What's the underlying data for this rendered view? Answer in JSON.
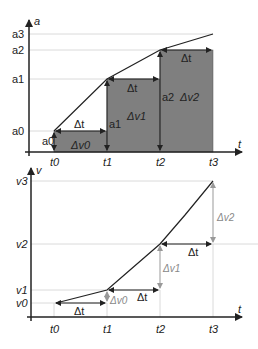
{
  "top_chart": {
    "y_axis_label": "a",
    "x_axis_label": "t",
    "y_ticks": [
      "a0",
      "a1",
      "a2",
      "a3"
    ],
    "x_ticks": [
      "t0",
      "t1",
      "t2",
      "t3"
    ],
    "rect_height_labels": [
      "a0",
      "a1",
      "a2"
    ],
    "rect_width_label": "Δt",
    "rect_area_labels": [
      "Δv0",
      "Δv1",
      "Δv2"
    ],
    "fill_color": "#7f7f7f"
  },
  "bottom_chart": {
    "y_axis_label": "v",
    "x_axis_label": "t",
    "y_ticks": [
      "v0",
      "v1",
      "v2",
      "v3"
    ],
    "x_ticks": [
      "t0",
      "t1",
      "t2",
      "t3"
    ],
    "step_width_label": "Δt",
    "step_rise_labels": [
      "Δv0",
      "Δv1",
      "Δv2"
    ]
  }
}
